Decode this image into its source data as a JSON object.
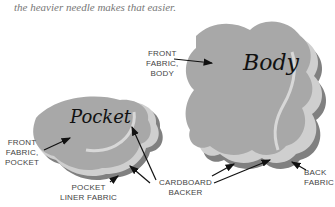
{
  "caption": {
    "line_partial": "by hand, the heavier needle",
    "line": "the heavier needle makes that easier."
  },
  "pieces": {
    "body": {
      "title": "Body"
    },
    "pocket": {
      "title": "Pocket"
    }
  },
  "labels": {
    "front_fabric_body": [
      "FRONT",
      "FABRIC,",
      "BODY"
    ],
    "front_fabric_pocket": [
      "FRONT",
      "FABRIC,",
      "POCKET"
    ],
    "pocket_liner": [
      "POCKET",
      "LINER FABRIC"
    ],
    "cardboard_backer": [
      "CARDBOARD",
      "BACKER"
    ],
    "back_fabric": [
      "BACK",
      "FABRIC"
    ]
  },
  "colors": {
    "fabric": "#a9a9a9",
    "shadow": "#7f7f7f",
    "backer": "#d2d2d2",
    "arrow": "#111111",
    "label": "#444444"
  }
}
